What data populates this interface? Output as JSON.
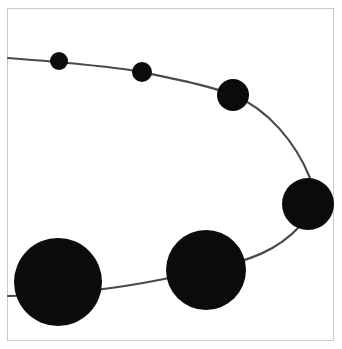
{
  "figure": {
    "title": "",
    "background_color": "#ffffff",
    "frame": {
      "border_color": "#c9c9c9",
      "border_width": 1,
      "x": 7,
      "y": 8,
      "width": 327,
      "height": 333
    }
  },
  "chart_data": {
    "type": "scatter",
    "title": "",
    "subtitle": "",
    "xlabel": "",
    "ylabel": "",
    "xlim": [
      0,
      342
    ],
    "ylim": [
      349,
      0
    ],
    "grid": false,
    "legend": null,
    "xticklabels": [],
    "yticklabels": [],
    "annotations": [],
    "marker_color": "#0b0b0b",
    "line_color": "#4a4a4a",
    "line_width": 2.2,
    "series": [
      {
        "name": "bubbles",
        "marker": "circle",
        "points": [
          {
            "x": 59,
            "y": 61,
            "r": 9,
            "label": ""
          },
          {
            "x": 142,
            "y": 72,
            "r": 10,
            "label": ""
          },
          {
            "x": 233,
            "y": 95,
            "r": 16,
            "label": ""
          },
          {
            "x": 308,
            "y": 204,
            "r": 26,
            "label": ""
          },
          {
            "x": 206,
            "y": 270,
            "r": 40,
            "label": ""
          },
          {
            "x": 58,
            "y": 282,
            "r": 44,
            "label": ""
          }
        ]
      }
    ],
    "curve": {
      "name": "connector-curve",
      "start": {
        "x": 8,
        "y": 58
      },
      "end": {
        "x": 8,
        "y": 296
      },
      "path": "M 8 58 C 60 62, 110 66, 142 72 C 180 80, 210 86, 233 95 C 268 109, 296 143, 310 178 C 312 196, 310 214, 300 226 C 278 250, 250 261, 206 270 C 150 283, 100 291, 60 293 C 40 295, 22 296, 8 296"
    }
  }
}
